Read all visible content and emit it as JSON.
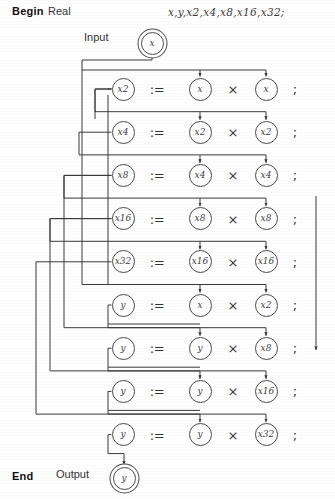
{
  "diagram": {
    "begin_label": "Begin",
    "type_label": "Real",
    "declaration": "x,y,x2,x4,x8,x16,x32;",
    "input_label": "Input",
    "input_var": "x",
    "output_label": "Output",
    "output_var": "y",
    "end_label": "End",
    "assign_symbol": ":=",
    "multiply_symbol": "×",
    "terminator": ";",
    "ink_color": "#3a3a3a",
    "paper_color": "#fefefe",
    "statements": [
      {
        "lhs": "x2",
        "left": "x",
        "right": "x",
        "op": "×"
      },
      {
        "lhs": "x4",
        "left": "x2",
        "right": "x2",
        "op": "×"
      },
      {
        "lhs": "x8",
        "left": "x4",
        "right": "x4",
        "op": "×"
      },
      {
        "lhs": "x16",
        "left": "x8",
        "right": "x8",
        "op": "×"
      },
      {
        "lhs": "x32",
        "left": "x16",
        "right": "x16",
        "op": "×"
      },
      {
        "lhs": "y",
        "left": "x",
        "right": "x2",
        "op": "×"
      },
      {
        "lhs": "y",
        "left": "y",
        "right": "x8",
        "op": "×"
      },
      {
        "lhs": "y",
        "left": "y",
        "right": "x16",
        "op": "×"
      },
      {
        "lhs": "y",
        "left": "y",
        "right": "x32",
        "op": "×"
      }
    ]
  }
}
